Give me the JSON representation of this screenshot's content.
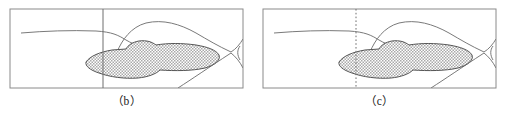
{
  "figure": {
    "type": "geological-cross-section-pair",
    "panels": [
      {
        "id": "b",
        "caption": "（b）",
        "reference_line_style": "solid",
        "reference_line_x": 0.4,
        "shaded_region_label": "stippled-anomaly-body",
        "frame": {
          "x": 10,
          "y": 9,
          "width": 233,
          "height": 79
        }
      },
      {
        "id": "c",
        "caption": "（c）",
        "reference_line_style": "dotted",
        "reference_line_x": 0.4,
        "shaded_region_label": "stippled-anomaly-body",
        "frame": {
          "x": 10,
          "y": 9,
          "width": 233,
          "height": 79
        }
      }
    ],
    "colors": {
      "frame_stroke": "#8a8a8a",
      "contour_stroke": "#7a7a7a",
      "shade_fill": "#b8b8b8",
      "shade_outline": "#555555",
      "caption_text": "#1a1a1a",
      "background": "#ffffff"
    }
  }
}
